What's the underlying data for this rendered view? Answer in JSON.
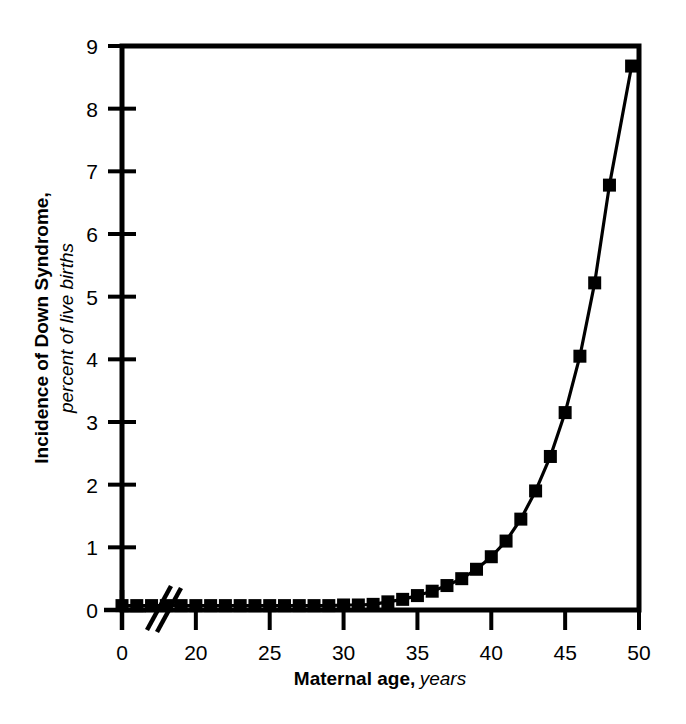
{
  "chart_data": {
    "type": "line",
    "title": "",
    "xlabel_bold": "Maternal age",
    "xlabel_sep": ",",
    "xlabel_italic": "years",
    "ylabel_bold": "Incidence of Down Syndrome,",
    "ylabel_italic": "percent of live births",
    "xlim": [
      15,
      50
    ],
    "ylim": [
      0,
      9
    ],
    "x_axis_break": true,
    "x_break_origin_label": "0",
    "xticks": [
      20,
      25,
      30,
      35,
      40,
      45,
      50
    ],
    "xtick_labels": [
      "20",
      "25",
      "30",
      "35",
      "40",
      "45",
      "50"
    ],
    "yticks": [
      0,
      1,
      2,
      3,
      4,
      5,
      6,
      7,
      8,
      9
    ],
    "ytick_labels": [
      "0",
      "1",
      "2",
      "3",
      "4",
      "5",
      "6",
      "7",
      "8",
      "9"
    ],
    "grid": false,
    "legend": false,
    "marker": "square-filled",
    "marker_color": "#000000",
    "line_color": "#000000",
    "frame_color": "#000000",
    "background": "#ffffff",
    "series": [
      {
        "name": "Incidence of Down Syndrome",
        "x": [
          15,
          16,
          17,
          18,
          19,
          20,
          21,
          22,
          23,
          24,
          25,
          26,
          27,
          28,
          29,
          30,
          31,
          32,
          33,
          34,
          35,
          36,
          37,
          38,
          39,
          40,
          41,
          42,
          43,
          44,
          45,
          46,
          47,
          48,
          49.5
        ],
        "values": [
          0.07,
          0.07,
          0.07,
          0.07,
          0.07,
          0.07,
          0.07,
          0.07,
          0.07,
          0.07,
          0.07,
          0.07,
          0.07,
          0.07,
          0.07,
          0.08,
          0.08,
          0.09,
          0.13,
          0.17,
          0.23,
          0.3,
          0.39,
          0.5,
          0.65,
          0.85,
          1.1,
          1.45,
          1.9,
          2.45,
          3.15,
          4.05,
          5.22,
          6.78,
          8.68
        ]
      }
    ]
  },
  "axis": {
    "origin_label": "0"
  }
}
